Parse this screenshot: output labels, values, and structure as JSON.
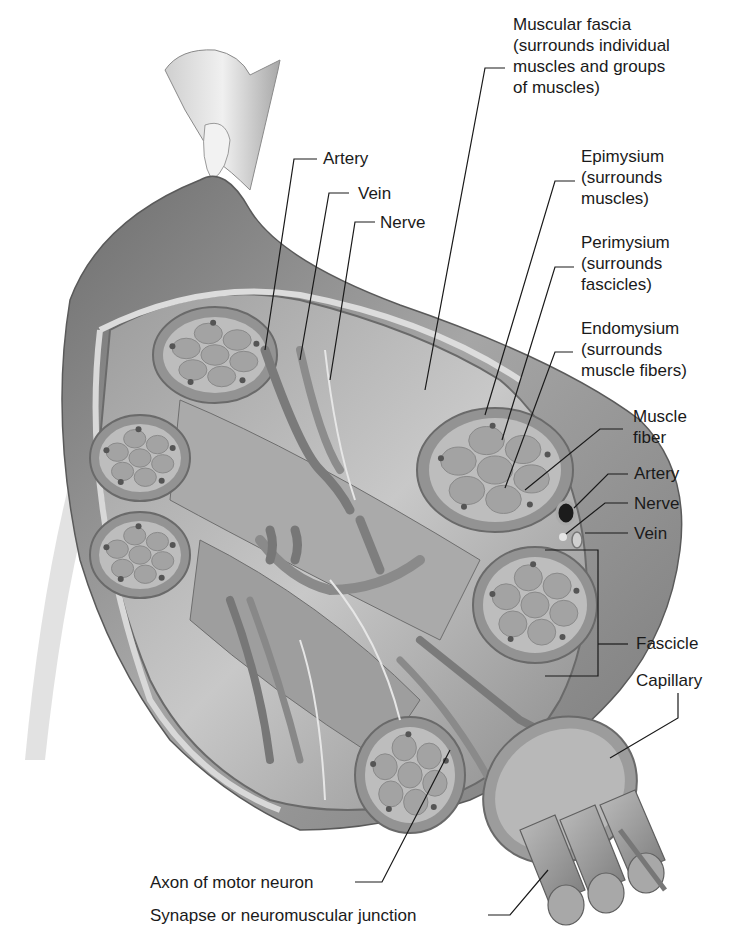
{
  "figure": {
    "colors": {
      "background": "#ffffff",
      "muscle_surface": "#8c8c8c",
      "fascicle_fill": "#9a9a9a",
      "fiber_fill": "#a8a8a8",
      "connective_tissue": "#b4b4b4",
      "label_text": "#1a1a1a",
      "leader_line": "#1a1a1a"
    }
  },
  "labels": {
    "muscular_fascia": [
      "Muscular fascia",
      "(surrounds individual",
      "muscles and groups",
      "of muscles)"
    ],
    "artery_top": "Artery",
    "vein_top": "Vein",
    "nerve_top": "Nerve",
    "epimysium": [
      "Epimysium",
      "(surrounds",
      "muscles)"
    ],
    "perimysium": [
      "Perimysium",
      "(surrounds",
      "fascicles)"
    ],
    "endomysium": [
      "Endomysium",
      "(surrounds",
      "muscle fibers)"
    ],
    "muscle_fiber": [
      "Muscle",
      "fiber"
    ],
    "artery_right": "Artery",
    "nerve_right": "Nerve",
    "vein_right": "Vein",
    "fascicle": "Fascicle",
    "capillary": "Capillary",
    "axon": "Axon of motor neuron",
    "synapse": "Synapse or neuromuscular junction"
  }
}
